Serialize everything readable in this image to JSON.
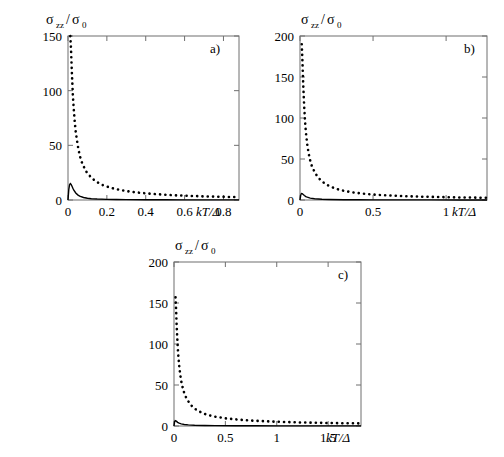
{
  "figure": {
    "background_color": "#ffffff",
    "axis_color": "#6f6f6f",
    "curve_color": "#000000"
  },
  "chart_data": [
    {
      "type": "line",
      "title": "",
      "panel_tag": "a)",
      "xlabel": "kT/Δ",
      "ylabel": "σzz/σ0",
      "ylabel_parts": {
        "sigma": "σ",
        "sub_zz": "zz",
        "slash": "/",
        "sigma2": "σ",
        "sub_0": "0"
      },
      "xlim": [
        0,
        0.88
      ],
      "ylim": [
        0,
        150
      ],
      "xticks": [
        0,
        0.2,
        0.4,
        0.6,
        0.8
      ],
      "xticklabels": [
        "0",
        "0.2",
        "0.4",
        "0.6",
        "0.8"
      ],
      "yticks": [
        0,
        50,
        100,
        150
      ],
      "yticklabels": [
        "0",
        "50",
        "100",
        "150"
      ],
      "grid": false,
      "legend": "none",
      "series": [
        {
          "name": "dotted",
          "style": "dotted",
          "x": [
            0.012,
            0.015,
            0.018,
            0.021,
            0.025,
            0.03,
            0.035,
            0.04,
            0.05,
            0.06,
            0.07,
            0.08,
            0.09,
            0.1,
            0.12,
            0.14,
            0.16,
            0.18,
            0.2,
            0.24,
            0.28,
            0.32,
            0.36,
            0.4,
            0.45,
            0.5,
            0.55,
            0.6,
            0.65,
            0.7,
            0.75,
            0.8,
            0.85,
            0.88
          ],
          "y": [
            150,
            140,
            126,
            112,
            96,
            82,
            71,
            62,
            50,
            41,
            35,
            31,
            27,
            24.5,
            20.5,
            17.5,
            15.3,
            13.6,
            12.3,
            10.2,
            8.8,
            7.6,
            6.8,
            6.1,
            5.4,
            4.8,
            4.3,
            4.0,
            3.6,
            3.3,
            3.1,
            2.9,
            2.7,
            2.6
          ]
        },
        {
          "name": "solid",
          "style": "solid",
          "x": [
            0.0,
            0.004,
            0.008,
            0.012,
            0.016,
            0.02,
            0.025,
            0.03,
            0.04,
            0.05,
            0.06,
            0.08,
            0.1,
            0.12,
            0.15,
            0.2,
            0.25,
            0.3,
            0.4,
            0.5,
            0.6,
            0.7,
            0.8,
            0.88
          ],
          "y": [
            0.0,
            9.5,
            14.0,
            15.0,
            14.2,
            12.8,
            10.8,
            9.0,
            6.4,
            4.7,
            3.6,
            2.3,
            1.6,
            1.2,
            0.85,
            0.55,
            0.4,
            0.32,
            0.22,
            0.17,
            0.14,
            0.12,
            0.1,
            0.09
          ]
        }
      ]
    },
    {
      "type": "line",
      "title": "",
      "panel_tag": "b)",
      "xlabel": "kT/Δ",
      "ylabel": "σzz/σ0",
      "ylabel_parts": {
        "sigma": "σ",
        "sub_zz": "zz",
        "slash": "/",
        "sigma2": "σ",
        "sub_0": "0"
      },
      "xlim": [
        0,
        1.28
      ],
      "ylim": [
        0,
        200
      ],
      "xticks": [
        0,
        0.5,
        1
      ],
      "xticklabels": [
        "0",
        "0.5",
        "1"
      ],
      "yticks": [
        0,
        50,
        100,
        150,
        200
      ],
      "yticklabels": [
        "0",
        "50",
        "100",
        "150",
        "200"
      ],
      "grid": false,
      "legend": "none",
      "series": [
        {
          "name": "dotted",
          "style": "dotted",
          "x": [
            0.012,
            0.015,
            0.018,
            0.022,
            0.026,
            0.03,
            0.035,
            0.04,
            0.05,
            0.06,
            0.07,
            0.08,
            0.1,
            0.12,
            0.14,
            0.17,
            0.2,
            0.25,
            0.3,
            0.35,
            0.4,
            0.45,
            0.5,
            0.6,
            0.7,
            0.8,
            0.9,
            1.0,
            1.1,
            1.2,
            1.28
          ],
          "y": [
            190,
            178,
            162,
            142,
            124,
            110,
            95,
            83,
            67,
            56,
            48,
            42,
            34,
            28.5,
            24.5,
            20,
            17,
            13.5,
            11.2,
            9.6,
            8.4,
            7.4,
            6.7,
            5.6,
            4.8,
            4.2,
            3.8,
            3.4,
            3.1,
            2.9,
            2.7
          ]
        },
        {
          "name": "solid",
          "style": "solid",
          "x": [
            0.0,
            0.005,
            0.01,
            0.015,
            0.02,
            0.03,
            0.04,
            0.05,
            0.07,
            0.1,
            0.15,
            0.2,
            0.3,
            0.4,
            0.5,
            0.7,
            0.9,
            1.1,
            1.28
          ],
          "y": [
            0.0,
            6.0,
            8.0,
            7.8,
            7.0,
            5.4,
            4.2,
            3.4,
            2.3,
            1.5,
            0.85,
            0.58,
            0.33,
            0.24,
            0.19,
            0.14,
            0.11,
            0.09,
            0.08
          ]
        }
      ]
    },
    {
      "type": "line",
      "title": "",
      "panel_tag": "c)",
      "xlabel": "kT/Δ",
      "ylabel": "σzz/σ0",
      "ylabel_parts": {
        "sigma": "σ",
        "sub_zz": "zz",
        "slash": "/",
        "sigma2": "σ",
        "sub_0": "0"
      },
      "xlim": [
        0,
        1.82
      ],
      "ylim": [
        0,
        200
      ],
      "xticks": [
        0,
        0.5,
        1,
        1.5
      ],
      "xticklabels": [
        "0",
        "0.5",
        "1",
        "1.5"
      ],
      "yticks": [
        0,
        50,
        100,
        150,
        200
      ],
      "yticklabels": [
        "0",
        "50",
        "100",
        "150",
        "200"
      ],
      "grid": false,
      "legend": "none",
      "series": [
        {
          "name": "dotted",
          "style": "dotted",
          "x": [
            0.015,
            0.02,
            0.025,
            0.03,
            0.035,
            0.04,
            0.05,
            0.06,
            0.07,
            0.08,
            0.1,
            0.12,
            0.15,
            0.18,
            0.22,
            0.26,
            0.3,
            0.35,
            0.4,
            0.5,
            0.6,
            0.7,
            0.8,
            0.9,
            1.0,
            1.2,
            1.4,
            1.6,
            1.8,
            1.82
          ],
          "y": [
            157,
            143,
            126,
            112,
            99,
            89,
            74,
            63,
            55,
            49,
            40,
            34,
            28,
            23.5,
            19.5,
            16.8,
            14.7,
            12.8,
            11.4,
            9.4,
            8.1,
            7.1,
            6.3,
            5.7,
            5.2,
            4.4,
            3.9,
            3.5,
            3.2,
            3.1
          ]
        },
        {
          "name": "solid",
          "style": "solid",
          "x": [
            0.0,
            0.006,
            0.012,
            0.018,
            0.025,
            0.035,
            0.05,
            0.07,
            0.1,
            0.14,
            0.2,
            0.3,
            0.4,
            0.6,
            0.8,
            1.0,
            1.3,
            1.6,
            1.82
          ],
          "y": [
            0.0,
            5.2,
            6.6,
            6.3,
            5.6,
            4.5,
            3.4,
            2.6,
            1.9,
            1.4,
            1.0,
            0.62,
            0.45,
            0.29,
            0.22,
            0.18,
            0.13,
            0.11,
            0.1
          ]
        }
      ]
    }
  ]
}
